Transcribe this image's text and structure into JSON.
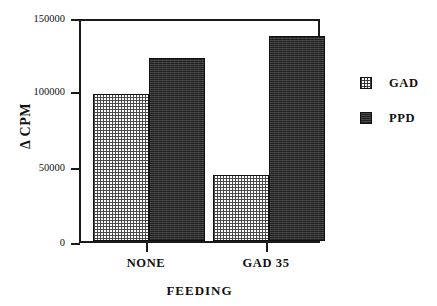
{
  "chart_data": {
    "type": "bar",
    "title": "",
    "subtitle": "",
    "xlabel": "FEEDING",
    "ylabel": "Δ CPM",
    "categories": [
      "NONE",
      "GAD 35"
    ],
    "series": [
      {
        "name": "GAD",
        "values": [
          100000,
          45000
        ]
      },
      {
        "name": "PPD",
        "values": [
          125000,
          140000
        ]
      }
    ],
    "ylim": [
      0,
      150000
    ],
    "yticks": [
      0,
      50000,
      100000,
      150000
    ],
    "ytick_labels": [
      "0",
      "50000",
      "100000",
      "150000"
    ],
    "xtick_labels": [
      "NONE",
      "GAD 35"
    ],
    "grid": false,
    "legend_position": "right",
    "legend_entries": [
      "GAD",
      "PPD"
    ],
    "colors": {
      "gad_fill": "#ffffff",
      "gad_pattern": "#4a4a4a",
      "ppd_fill": "#3a3a3a",
      "axis": "#1a1a1a",
      "text": "#111111",
      "background": "#ffffff"
    }
  },
  "axes": {
    "y_title": "Δ CPM",
    "x_title": "FEEDING",
    "y_ticks": [
      {
        "label": "150000",
        "value": 150000
      },
      {
        "label": "100000",
        "value": 100000
      },
      {
        "label": "50000",
        "value": 50000
      },
      {
        "label": "0",
        "value": 0
      }
    ],
    "x_ticks": [
      {
        "label": "NONE"
      },
      {
        "label": "GAD 35"
      }
    ]
  },
  "legend": {
    "items": [
      {
        "label": "GAD",
        "swatch": "dotted-pattern-swatch"
      },
      {
        "label": "PPD",
        "swatch": "dark-solid-swatch"
      }
    ]
  }
}
